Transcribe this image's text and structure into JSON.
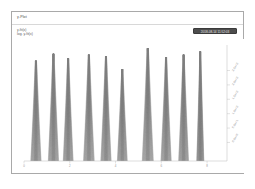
{
  "window": {
    "background_color": "#ffffff",
    "card_border_color": "#a9a9a9"
  },
  "header": {
    "title": "y-Plot"
  },
  "legend": {
    "line1": "y-fit(x)",
    "line2": "log. y-fit(x)",
    "badge_label": "2018-08-14 11:52:03",
    "badge_color": "#4d4d4d"
  },
  "plot": {
    "series_color": "#7d7d7d",
    "grid": false,
    "right_axis_ticks": [
      "2.5e+2",
      "2.0e+2",
      "1.5e+2",
      "1.0e+2",
      "5.0e+1",
      "0.0e+0"
    ],
    "bottom_axis_ticks": [
      "0",
      "2",
      "4",
      "6",
      "8"
    ]
  },
  "chart_data": {
    "type": "line",
    "title": "y-Plot",
    "xlabel": "",
    "ylabel": "y-fit(x)",
    "xlim": [
      0,
      10
    ],
    "ylim": [
      0,
      250
    ],
    "grid": false,
    "legend": [
      "y-fit(x)",
      "log. y-fit(x)"
    ],
    "annotations": [
      "2018-08-14 11:52:03"
    ],
    "burst_count": 10,
    "lines_per_burst": 46,
    "bursts": [
      {
        "index": 1,
        "center_x": 0.6,
        "peak_y": 216,
        "base_half_width": 0.26,
        "top_half_width": 0.03
      },
      {
        "index": 2,
        "center_x": 1.48,
        "peak_y": 231,
        "base_half_width": 0.26,
        "top_half_width": 0.03
      },
      {
        "index": 3,
        "center_x": 2.22,
        "peak_y": 221,
        "base_half_width": 0.25,
        "top_half_width": 0.028
      },
      {
        "index": 4,
        "center_x": 3.26,
        "peak_y": 229,
        "base_half_width": 0.27,
        "top_half_width": 0.03
      },
      {
        "index": 5,
        "center_x": 4.12,
        "peak_y": 226,
        "base_half_width": 0.26,
        "top_half_width": 0.028
      },
      {
        "index": 6,
        "center_x": 4.94,
        "peak_y": 198,
        "base_half_width": 0.25,
        "top_half_width": 0.028
      },
      {
        "index": 7,
        "center_x": 6.22,
        "peak_y": 243,
        "base_half_width": 0.28,
        "top_half_width": 0.032
      },
      {
        "index": 8,
        "center_x": 7.14,
        "peak_y": 224,
        "base_half_width": 0.26,
        "top_half_width": 0.028
      },
      {
        "index": 9,
        "center_x": 8.02,
        "peak_y": 229,
        "base_half_width": 0.25,
        "top_half_width": 0.028
      },
      {
        "index": 10,
        "center_x": 8.86,
        "peak_y": 236,
        "base_half_width": 0.18,
        "top_half_width": 0.022
      }
    ]
  }
}
